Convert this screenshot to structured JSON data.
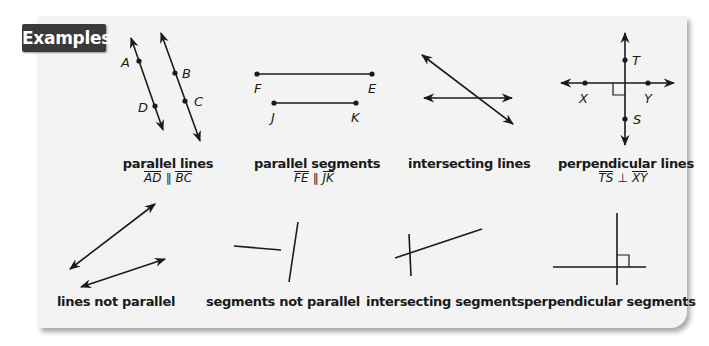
{
  "header": {
    "title": "Examples"
  },
  "colors": {
    "badge_bg": "#3a3a3a",
    "panel_bg": "#f3f3f3",
    "ink": "#1a1a1a"
  },
  "examples": [
    {
      "caption": "parallel lines",
      "notation": {
        "left": "AD",
        "symbol": "∥",
        "right": "BC",
        "type": "line"
      },
      "points": [
        "A",
        "B",
        "C",
        "D"
      ]
    },
    {
      "caption": "parallel segments",
      "notation": {
        "left": "FE",
        "symbol": "∥",
        "right": "JK",
        "type": "segment"
      },
      "points": [
        "F",
        "E",
        "J",
        "K"
      ]
    },
    {
      "caption": "intersecting lines"
    },
    {
      "caption": "perpendicular lines",
      "notation": {
        "left": "TS",
        "symbol": "⊥",
        "right": "XY",
        "type": "line"
      },
      "points": [
        "T",
        "X",
        "Y",
        "S"
      ]
    },
    {
      "caption": "lines not parallel"
    },
    {
      "caption": "segments not parallel"
    },
    {
      "caption": "intersecting segments"
    },
    {
      "caption": "perpendicular segments"
    }
  ]
}
